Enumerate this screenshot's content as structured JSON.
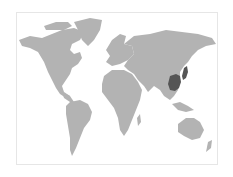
{
  "map": {
    "type": "world-choropleth",
    "land_color": "#b3b3b3",
    "highlight_color": "#555555",
    "background_color": "#ffffff",
    "border_color": "#e6e6e6",
    "highlighted_regions": [
      "China",
      "Japan"
    ],
    "regions": [
      {
        "name": "North America",
        "highlighted": false
      },
      {
        "name": "Greenland",
        "highlighted": false
      },
      {
        "name": "South America",
        "highlighted": false
      },
      {
        "name": "Europe",
        "highlighted": false
      },
      {
        "name": "Africa",
        "highlighted": false
      },
      {
        "name": "Asia",
        "highlighted": false
      },
      {
        "name": "China",
        "highlighted": true
      },
      {
        "name": "Japan",
        "highlighted": true
      },
      {
        "name": "Australia",
        "highlighted": false
      },
      {
        "name": "New Zealand",
        "highlighted": false
      }
    ]
  }
}
